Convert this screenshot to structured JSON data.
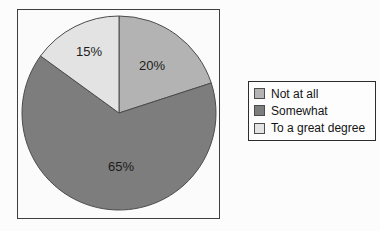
{
  "chart_data": {
    "type": "pie",
    "title": "",
    "slices": [
      {
        "label": "Not at all",
        "value": 20,
        "pct_label": "20%",
        "color": "#b3b3b3"
      },
      {
        "label": "Somewhat",
        "value": 65,
        "pct_label": "65%",
        "color": "#7d7d7d"
      },
      {
        "label": "To a great degree",
        "value": 15,
        "pct_label": "15%",
        "color": "#e3e3e3"
      }
    ],
    "start_angle_deg": 0,
    "direction": "clockwise",
    "legend_position": "right",
    "stroke_color": "#4c4c4c",
    "label_color": "#1b1b1b"
  }
}
